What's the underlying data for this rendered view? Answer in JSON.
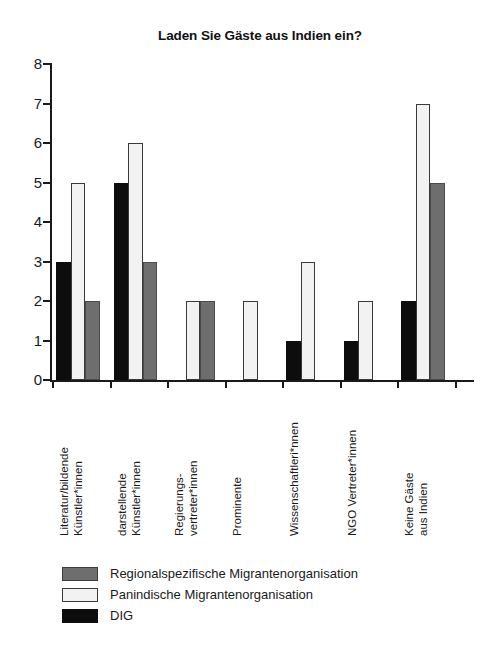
{
  "chart_data": {
    "type": "bar",
    "title": "Laden Sie Gäste aus Indien ein?",
    "xlabel": "",
    "ylabel": "",
    "ylim": [
      0,
      8
    ],
    "ytick_labels": [
      "8",
      "7",
      "6",
      "5",
      "4",
      "3",
      "2",
      "1",
      "0"
    ],
    "yticks": [
      8,
      7,
      6,
      5,
      4,
      3,
      2,
      1,
      0
    ],
    "grid": false,
    "legend_position": "bottom-left",
    "categories": [
      "Literatur/bildende Künstler*innen",
      "darstellende Künstler*innen",
      "Regierungs-vertreter*innen",
      "Prominente",
      "Wissenschaftleri*nnen",
      "NGO Vertreter*innen",
      "Keine Gäste aus Indien"
    ],
    "category_lines": [
      [
        "Literatur/bildende",
        "Künstler*innen"
      ],
      [
        "darstellende",
        "Künstler*innen"
      ],
      [
        "Regierungs-",
        "vertreter*innen"
      ],
      [
        "Prominente"
      ],
      [
        "Wissenschaftleri*nnen"
      ],
      [
        "NGO Vertreter*innen"
      ],
      [
        "Keine Gäste",
        "aus Indien"
      ]
    ],
    "series": [
      {
        "name": "DIG",
        "key": "dig",
        "color": "#0d0d0d",
        "values": [
          3,
          5,
          0,
          0,
          1,
          1,
          2
        ]
      },
      {
        "name": "Panindische Migrantenorganisation",
        "key": "pan",
        "color": "#f2f2f2",
        "values": [
          5,
          6,
          2,
          2,
          3,
          2,
          7
        ]
      },
      {
        "name": "Regionalspezifische Migrantenorganisation",
        "key": "reg",
        "color": "#6e6e6e",
        "values": [
          2,
          3,
          2,
          0,
          0,
          0,
          5
        ]
      }
    ]
  },
  "legend": {
    "entries": [
      {
        "label": "Regionalspezifische Migrantenorganisation",
        "key": "reg"
      },
      {
        "label": "Panindische Migrantenorganisation",
        "key": "pan"
      },
      {
        "label": "DIG",
        "key": "dig"
      }
    ]
  }
}
